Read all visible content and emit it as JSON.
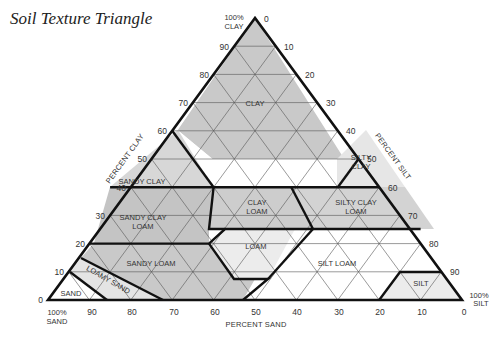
{
  "title": "Soil Texture Triangle",
  "vertices": {
    "clay": {
      "line1": "100%",
      "line2": "CLAY"
    },
    "sand": {
      "line1": "100%",
      "line2": "SAND"
    },
    "silt": {
      "line1": "100%",
      "line2": "SILT"
    }
  },
  "axes": {
    "clay": {
      "title": "PERCENT CLAY",
      "ticks": [
        "0",
        "10",
        "20",
        "30",
        "40",
        "50",
        "60",
        "70",
        "80",
        "90"
      ]
    },
    "silt": {
      "title": "PERCENT SILT",
      "ticks": [
        "0",
        "10",
        "20",
        "30",
        "40",
        "50",
        "60",
        "70",
        "80",
        "90"
      ]
    },
    "sand": {
      "title": "PERCENT SAND",
      "ticks": [
        "90",
        "80",
        "70",
        "60",
        "50",
        "40",
        "30",
        "20",
        "10",
        "0"
      ]
    }
  },
  "regions": [
    {
      "id": "clay",
      "lines": [
        "CLAY"
      ],
      "fill": "#c9c9c9"
    },
    {
      "id": "sandy-clay",
      "lines": [
        "SANDY CLAY"
      ],
      "fill": "#d7d7d7"
    },
    {
      "id": "silty-clay",
      "lines": [
        "SILTY",
        "CLAY"
      ],
      "fill": "#e6e6e6"
    },
    {
      "id": "sandy-clay-loam",
      "lines": [
        "SANDY CLAY",
        "LOAM"
      ],
      "fill": "#c4c4c4"
    },
    {
      "id": "clay-loam",
      "lines": [
        "CLAY",
        "LOAM"
      ],
      "fill": "#cdcdcd"
    },
    {
      "id": "silty-clay-loam",
      "lines": [
        "SILTY CLAY",
        "LOAM"
      ],
      "fill": "#d3d3d3"
    },
    {
      "id": "loam",
      "lines": [
        "LOAM"
      ],
      "fill": "#ececec"
    },
    {
      "id": "sandy-loam",
      "lines": [
        "SANDY LOAM"
      ],
      "fill": "#c9c9c9"
    },
    {
      "id": "silt-loam",
      "lines": [
        "SILT LOAM"
      ],
      "fill": "#ffffff"
    },
    {
      "id": "loamy-sand",
      "lines": [
        "LOAMY SAND"
      ],
      "fill": "#e4e4e4"
    },
    {
      "id": "sand",
      "lines": [
        "SAND"
      ],
      "fill": "#ffffff"
    },
    {
      "id": "silt",
      "lines": [
        "SILT"
      ],
      "fill": "#ececec"
    }
  ],
  "colors": {
    "border": "#111111",
    "grid": "#555555",
    "text": "#333333"
  }
}
